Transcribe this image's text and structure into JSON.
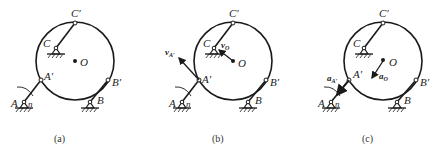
{
  "figures": [
    {
      "id": "a",
      "caption": "(a)",
      "labels": {
        "A": "A",
        "A_prime": "A′",
        "B": "B",
        "B_prime": "B′",
        "C": "C",
        "C_prime": "C′",
        "O": "O",
        "n": "n"
      }
    },
    {
      "id": "b",
      "caption": "(b)",
      "labels": {
        "A": "A",
        "A_prime": "A′",
        "B": "B",
        "B_prime": "B′",
        "C": "C",
        "C_prime": "C′",
        "O": "O",
        "n": "n"
      },
      "vectors": {
        "vA": "v",
        "vA_sub": "A′",
        "vO": "v",
        "vO_sub": "O"
      }
    },
    {
      "id": "c",
      "caption": "(c)",
      "labels": {
        "A": "A",
        "A_prime": "A′",
        "B": "B",
        "B_prime": "B′",
        "C": "C",
        "C_prime": "C′",
        "O": "O",
        "n": "n"
      },
      "vectors": {
        "aA": "a",
        "aA_sub": "A′",
        "aO": "a",
        "aO_sub": "O"
      }
    }
  ],
  "colors": {
    "line": "#1a1a1a",
    "background": "#ffffff"
  }
}
